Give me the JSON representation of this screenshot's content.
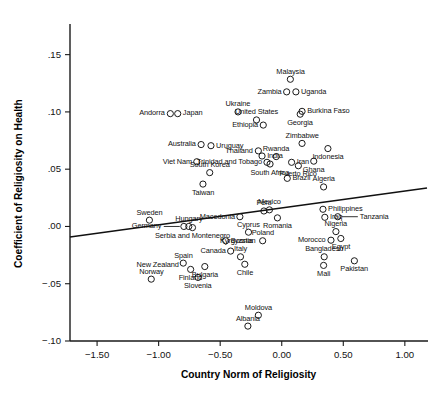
{
  "chart_data": {
    "type": "scatter",
    "title": "",
    "xlabel": "Country Norm of Religiosity",
    "ylabel": "Coefficient of Religiosity on Health",
    "xlim": [
      -1.72,
      1.18
    ],
    "ylim": [
      -0.1,
      0.175
    ],
    "xticks": [
      -1.5,
      -1.0,
      -0.5,
      0.0,
      0.5,
      1.0
    ],
    "xticklabels": [
      "−1.50",
      "−1.00",
      "−0.50",
      "0.00",
      "0.50",
      "1.00"
    ],
    "yticks": [
      -0.1,
      -0.05,
      0.0,
      0.05,
      0.1,
      0.15
    ],
    "yticklabels": [
      "−.10",
      "−.05",
      ".00",
      ".05",
      ".10",
      ".15"
    ],
    "grid": false,
    "legend": null,
    "marker": "open-circle",
    "fit_line": {
      "x": [
        -1.72,
        1.18
      ],
      "y": [
        -0.0092,
        0.0335
      ],
      "label": "linear fit"
    },
    "points": [
      {
        "label": "Andorra",
        "x": -0.905,
        "y": 0.0985,
        "lpos": "left"
      },
      {
        "label": "Japan",
        "x": -0.845,
        "y": 0.0985,
        "lpos": "right"
      },
      {
        "label": "Australia",
        "x": -0.655,
        "y": 0.0715,
        "lpos": "left"
      },
      {
        "label": "Uruguay",
        "x": -0.575,
        "y": 0.0705,
        "lpos": "right"
      },
      {
        "label": "Viet Nam",
        "x": -0.69,
        "y": 0.0565,
        "lpos": "left"
      },
      {
        "label": "South Korea",
        "x": -0.585,
        "y": 0.047,
        "lpos": "above"
      },
      {
        "label": "Taiwan",
        "x": -0.64,
        "y": 0.037,
        "lpos": "below"
      },
      {
        "label": "Sweden",
        "x": -1.075,
        "y": 0.0055,
        "lpos": "above"
      },
      {
        "label": "Germany",
        "x": -0.795,
        "y": 0.0,
        "lpos": "leader-left"
      },
      {
        "label": "Hungary",
        "x": -0.755,
        "y": 0.0,
        "lpos": "above"
      },
      {
        "label": "Serbia and Montenegro",
        "x": -0.725,
        "y": -0.001,
        "lpos": "below"
      },
      {
        "label": "New Zealand",
        "x": -1.01,
        "y": -0.034,
        "lpos": "labelonly-left"
      },
      {
        "label": "Norway",
        "x": -1.06,
        "y": -0.046,
        "lpos": "above"
      },
      {
        "label": "Spain",
        "x": -0.8,
        "y": -0.032,
        "lpos": "above"
      },
      {
        "label": "Finland",
        "x": -0.74,
        "y": -0.0375,
        "lpos": "below"
      },
      {
        "label": "Slovenia",
        "x": -0.68,
        "y": -0.0445,
        "lpos": "below"
      },
      {
        "label": "Bulgaria",
        "x": -0.625,
        "y": -0.035,
        "lpos": "below"
      },
      {
        "label": "Ukraine",
        "x": -0.355,
        "y": 0.1,
        "lpos": "above"
      },
      {
        "label": "United States",
        "x": -0.205,
        "y": 0.093,
        "lpos": "above"
      },
      {
        "label": "Ethiopia",
        "x": -0.15,
        "y": 0.0885,
        "lpos": "left"
      },
      {
        "label": "Thailand",
        "x": -0.19,
        "y": 0.066,
        "lpos": "left"
      },
      {
        "label": "India",
        "x": -0.16,
        "y": 0.0615,
        "lpos": "right"
      },
      {
        "label": "Trinidad and Tobago",
        "x": -0.12,
        "y": 0.056,
        "lpos": "left"
      },
      {
        "label": "South Africa",
        "x": -0.095,
        "y": 0.0545,
        "lpos": "below"
      },
      {
        "label": "Rwanda",
        "x": -0.045,
        "y": 0.061,
        "lpos": "above"
      },
      {
        "label": "Zambia",
        "x": 0.04,
        "y": 0.1175,
        "lpos": "left"
      },
      {
        "label": "Malaysia",
        "x": 0.07,
        "y": 0.1285,
        "lpos": "above"
      },
      {
        "label": "Uganda",
        "x": 0.115,
        "y": 0.1175,
        "lpos": "right"
      },
      {
        "label": "Burkina Faso",
        "x": 0.165,
        "y": 0.1005,
        "lpos": "right"
      },
      {
        "label": "Georgia",
        "x": 0.15,
        "y": 0.098,
        "lpos": "below"
      },
      {
        "label": "Zimbabwe",
        "x": 0.165,
        "y": 0.0725,
        "lpos": "above"
      },
      {
        "label": "Iran",
        "x": 0.08,
        "y": 0.056,
        "lpos": "right"
      },
      {
        "label": "Ghana",
        "x": 0.26,
        "y": 0.057,
        "lpos": "below"
      },
      {
        "label": "Indonesia",
        "x": 0.375,
        "y": 0.068,
        "lpos": "below"
      },
      {
        "label": "Puerto Rico",
        "x": 0.135,
        "y": 0.053,
        "lpos": "below"
      },
      {
        "label": "Brazil",
        "x": 0.045,
        "y": 0.042,
        "lpos": "right"
      },
      {
        "label": "Algeria",
        "x": 0.34,
        "y": 0.0345,
        "lpos": "above"
      },
      {
        "label": "Mexico",
        "x": -0.1,
        "y": 0.0145,
        "lpos": "above"
      },
      {
        "label": "Peru",
        "x": -0.145,
        "y": 0.0135,
        "lpos": "above"
      },
      {
        "label": "Philippines",
        "x": 0.335,
        "y": 0.015,
        "lpos": "right"
      },
      {
        "label": "Tanzania",
        "x": 0.455,
        "y": 0.0085,
        "lpos": "leader-right"
      },
      {
        "label": "Macedonia",
        "x": -0.34,
        "y": 0.0085,
        "lpos": "left"
      },
      {
        "label": "Romania",
        "x": -0.035,
        "y": 0.0075,
        "lpos": "below"
      },
      {
        "label": "Iraq",
        "x": 0.35,
        "y": 0.008,
        "lpos": "right"
      },
      {
        "label": "Cyprus",
        "x": -0.27,
        "y": -0.005,
        "lpos": "above"
      },
      {
        "label": "Poland",
        "x": -0.155,
        "y": -0.0125,
        "lpos": "above"
      },
      {
        "label": "Nigeria",
        "x": 0.44,
        "y": -0.0045,
        "lpos": "above"
      },
      {
        "label": "Morocco",
        "x": 0.4,
        "y": -0.012,
        "lpos": "left"
      },
      {
        "label": "Egypt",
        "x": 0.48,
        "y": -0.0105,
        "lpos": "below"
      },
      {
        "label": "Bosnia",
        "x": -0.455,
        "y": -0.0125,
        "lpos": "right"
      },
      {
        "label": "Canada",
        "x": -0.415,
        "y": -0.0215,
        "lpos": "left"
      },
      {
        "label": "Italy",
        "x": -0.335,
        "y": -0.0265,
        "lpos": "above"
      },
      {
        "label": "Kyrgyzstan",
        "x": -0.355,
        "y": -0.0125,
        "lpos": "labelonly-left"
      },
      {
        "label": "Chile",
        "x": -0.3,
        "y": -0.033,
        "lpos": "below"
      },
      {
        "label": "Bangladesh",
        "x": 0.345,
        "y": -0.0265,
        "lpos": "above"
      },
      {
        "label": "Mali",
        "x": 0.34,
        "y": -0.034,
        "lpos": "below"
      },
      {
        "label": "Pakistan",
        "x": 0.59,
        "y": -0.03,
        "lpos": "below"
      },
      {
        "label": "Moldova",
        "x": -0.19,
        "y": -0.0775,
        "lpos": "above"
      },
      {
        "label": "Albania",
        "x": -0.275,
        "y": -0.087,
        "lpos": "above"
      }
    ]
  }
}
